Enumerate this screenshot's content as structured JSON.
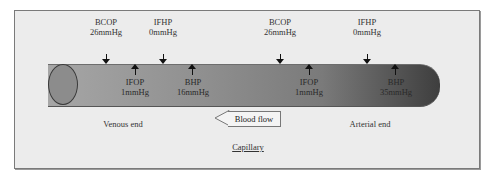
{
  "diagram": {
    "title": "Capillary",
    "flow_label": "Blood flow",
    "flow_direction": "left",
    "ends": {
      "left": "Venous end",
      "right": "Arterial end"
    },
    "venous_forces": [
      {
        "name": "BCOP",
        "value": "26mmHg",
        "direction": "into",
        "position": "above"
      },
      {
        "name": "IFHP",
        "value": "0mmHg",
        "direction": "into",
        "position": "above"
      },
      {
        "name": "IFOP",
        "value": "1mmHg",
        "direction": "out",
        "position": "inside"
      },
      {
        "name": "BHP",
        "value": "16mmHg",
        "direction": "out",
        "position": "inside"
      }
    ],
    "arterial_forces": [
      {
        "name": "BCOP",
        "value": "26mmHg",
        "direction": "into",
        "position": "above"
      },
      {
        "name": "IFHP",
        "value": "0mmHg",
        "direction": "into",
        "position": "above"
      },
      {
        "name": "IFOP",
        "value": "1mmHg",
        "direction": "out",
        "position": "inside"
      },
      {
        "name": "BHP",
        "value": "35mmHg",
        "direction": "out",
        "position": "inside"
      }
    ]
  }
}
